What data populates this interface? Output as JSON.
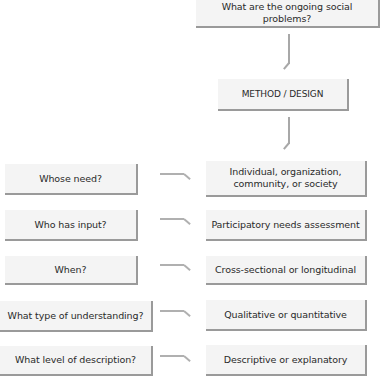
{
  "diagram": {
    "top_box": "What are the ongoing social problems?",
    "method_box": "METHOD / DESIGN",
    "rows": [
      {
        "question": "Whose need?",
        "answer": "Individual, organization, community, or society"
      },
      {
        "question": "Who has input?",
        "answer": "Participatory needs assessment"
      },
      {
        "question": "When?",
        "answer": "Cross-sectional or longitudinal"
      },
      {
        "question": "What type of understanding?",
        "answer": "Qualitative or quantitative"
      },
      {
        "question": "What level of description?",
        "answer": "Descriptive or explanatory"
      }
    ],
    "colors": {
      "box_fill": "#f4f4f4",
      "box_shadow": "#9a9a9a",
      "arrow": "#a8a8a8",
      "text": "#2a2a2a"
    }
  }
}
